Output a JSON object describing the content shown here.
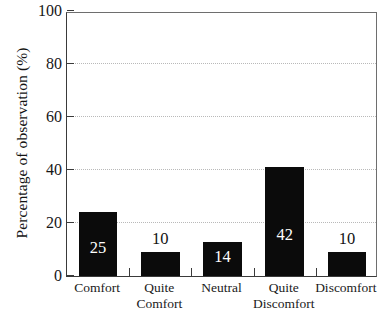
{
  "chart_data": {
    "type": "bar",
    "title": "",
    "xlabel": "",
    "ylabel": "Percentage of observation (%)",
    "ylim": [
      0,
      100
    ],
    "yticks": [
      0,
      20,
      40,
      60,
      80,
      100
    ],
    "ytick_labels": [
      "0",
      "20",
      "40",
      "60",
      "80",
      "100"
    ],
    "gridlines": [
      20,
      40,
      60,
      80
    ],
    "grid": true,
    "grid_style": "dotted-horizontal",
    "legend": null,
    "bar_color": "#0b0b0b",
    "categories": [
      "Comfort",
      "Quite Comfort",
      "Neutral",
      "Quite Discomfort",
      "Discomfort"
    ],
    "category_lines": [
      [
        "Comfort",
        ""
      ],
      [
        "Quite",
        "Comfort"
      ],
      [
        "Neutral",
        ""
      ],
      [
        "Quite",
        "Discomfort"
      ],
      [
        "Discomfort",
        ""
      ]
    ],
    "values": [
      24,
      9,
      13,
      41,
      9
    ],
    "data_labels": [
      "25",
      "10",
      "14",
      "42",
      "10"
    ],
    "label_placement": [
      "inside",
      "above",
      "inside",
      "inside",
      "above"
    ],
    "label_colors": [
      "#ffffff",
      "#111111",
      "#ffffff",
      "#ffffff",
      "#111111"
    ]
  },
  "axis": {
    "y_title": "Percentage of observation (%)"
  }
}
